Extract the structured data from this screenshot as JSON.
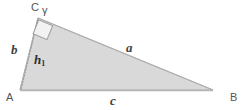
{
  "figure": {
    "type": "right-triangle-with-altitude",
    "background_color": "#ffffff",
    "fill_color": "#d9d9d9",
    "stroke_color": "#a8a8a8",
    "altitude_color": "#9a9a9a",
    "label_color": "#4a4a4a",
    "vertices": {
      "A": {
        "label": "A",
        "x": 20,
        "y": 90
      },
      "B": {
        "label": "B",
        "x": 213,
        "y": 90
      },
      "C": {
        "label": "C",
        "x": 38,
        "y": 18
      }
    },
    "sides": {
      "a": {
        "label": "a",
        "from": "C",
        "to": "B"
      },
      "b": {
        "label": "b",
        "from": "A",
        "to": "C"
      },
      "c": {
        "label": "c",
        "from": "A",
        "to": "B"
      }
    },
    "angles": {
      "gamma": {
        "label": "γ",
        "at": "C"
      }
    },
    "altitude": {
      "label": "h",
      "subscript": "1",
      "from": "C",
      "to_side": "c",
      "style": "dotted"
    },
    "right_angle_marker": {
      "name": "right-angle-square",
      "at": "C",
      "size": 15
    }
  }
}
